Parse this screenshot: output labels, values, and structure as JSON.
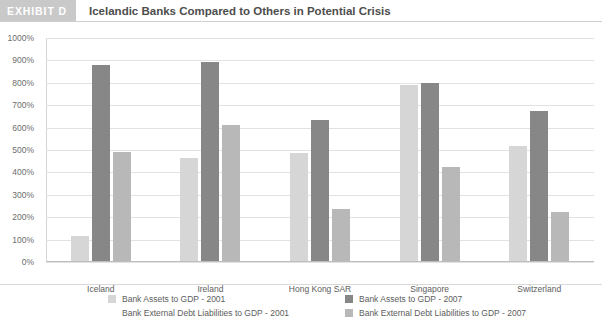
{
  "header": {
    "badge": "EXHIBIT D",
    "title": "Icelandic Banks Compared to Others in Potential Crisis"
  },
  "chart_data": {
    "type": "bar",
    "title": "Icelandic Banks Compared to Others in Potential Crisis",
    "xlabel": "",
    "ylabel": "",
    "ylim": [
      0,
      1000
    ],
    "ytick_labels": [
      "1000%",
      "900%",
      "800%",
      "700%",
      "600%",
      "500%",
      "400%",
      "300%",
      "200%",
      "100%",
      "0%"
    ],
    "ytick_values": [
      1000,
      900,
      800,
      700,
      600,
      500,
      400,
      300,
      200,
      100,
      0
    ],
    "grid": true,
    "legend_position": "bottom",
    "categories": [
      "Iceland",
      "Ireland",
      "Hong Kong SAR",
      "Singapore",
      "Switzerland"
    ],
    "series": [
      {
        "name": "Bank Assets to GDP - 2001",
        "color": "#d6d6d6",
        "values": [
          115,
          465,
          485,
          790,
          520
        ]
      },
      {
        "name": "Bank External Debt Liabilities to GDP - 2001",
        "color": "#e8e8e8",
        "values": [
          0,
          0,
          0,
          0,
          0
        ]
      },
      {
        "name": "Bank Assets to GDP - 2007",
        "color": "#878787",
        "values": [
          880,
          895,
          635,
          800,
          675
        ]
      },
      {
        "name": "Bank External Debt Liabilities to GDP - 2007",
        "color": "#b8b8b8",
        "values": [
          490,
          610,
          235,
          425,
          225
        ]
      }
    ]
  },
  "colors": {
    "badge_background": "#c9c9c9",
    "grid": "#e2e2e2",
    "axis": "#bdbdbd",
    "text": "#5d5d5d"
  }
}
